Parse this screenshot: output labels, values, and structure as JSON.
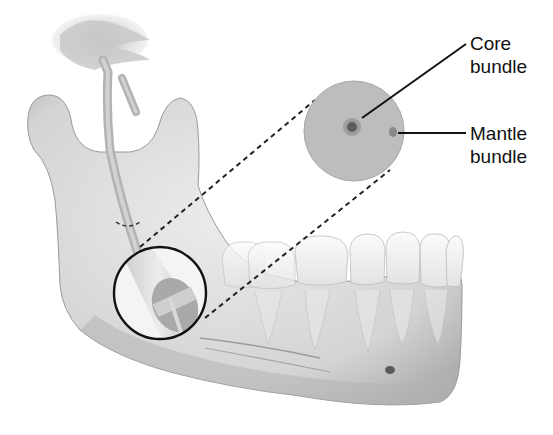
{
  "figure": {
    "labels": {
      "core": {
        "line1": "Core",
        "line2": "bundle"
      },
      "mantle": {
        "line1": "Mantle",
        "line2": "bundle"
      }
    },
    "colors": {
      "bone": "#d9d9d9",
      "bone_shadow": "#a8a8a8",
      "tooth": "#f2f2f2",
      "cross_section": "#b7b7b7",
      "bundle_core": "#6a6a6a",
      "leader": "#111111"
    }
  }
}
